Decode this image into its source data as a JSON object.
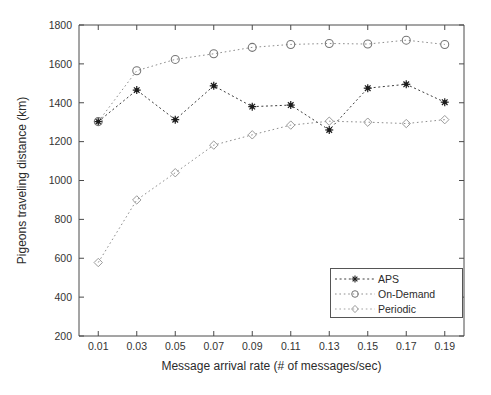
{
  "chart_data": {
    "type": "line",
    "title": "",
    "xlabel": "Message arrival rate (# of messages/sec)",
    "ylabel": "Pigeons traveling distance (km)",
    "x": [
      0.01,
      0.03,
      0.05,
      0.07,
      0.09,
      0.11,
      0.13,
      0.15,
      0.17,
      0.19
    ],
    "xtick_labels": [
      "0.01",
      "0.03",
      "0.05",
      "0.07",
      "0.09",
      "0.11",
      "0.13",
      "0.15",
      "0.17",
      "0.19"
    ],
    "ytick_labels": [
      "200",
      "400",
      "600",
      "800",
      "1000",
      "1200",
      "1400",
      "1600",
      "1800"
    ],
    "ytick_values": [
      200,
      400,
      600,
      800,
      1000,
      1200,
      1400,
      1600,
      1800
    ],
    "xlim": [
      0.0,
      0.2
    ],
    "ylim": [
      200,
      1800
    ],
    "grid": false,
    "legend_position": "lower-right",
    "series": [
      {
        "name": "APS",
        "marker": "star",
        "color": "#1c1c1c",
        "values": [
          1303,
          1465,
          1313,
          1487,
          1380,
          1388,
          1260,
          1475,
          1495,
          1403
        ]
      },
      {
        "name": "On-Demand",
        "marker": "circle",
        "color": "#757575",
        "values": [
          1303,
          1565,
          1623,
          1652,
          1685,
          1700,
          1705,
          1702,
          1722,
          1700
        ]
      },
      {
        "name": "Periodic",
        "marker": "diamond",
        "color": "#9a9a9a",
        "values": [
          578,
          900,
          1040,
          1182,
          1235,
          1285,
          1305,
          1300,
          1293,
          1313
        ]
      }
    ]
  },
  "legend": {
    "items": [
      {
        "label": "APS"
      },
      {
        "label": "On-Demand"
      },
      {
        "label": "Periodic"
      }
    ]
  }
}
